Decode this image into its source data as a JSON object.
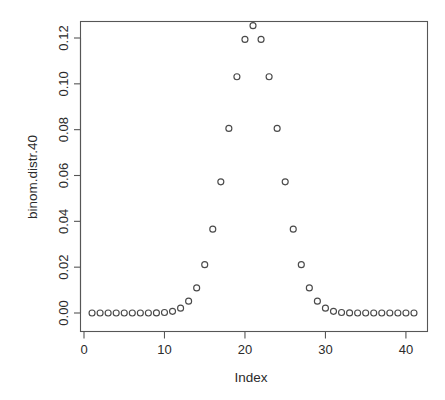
{
  "chart_data": {
    "type": "scatter",
    "title": "",
    "xlabel": "Index",
    "ylabel": "binom.distr.40",
    "xlim": [
      0,
      42
    ],
    "ylim": [
      0.0,
      0.1254
    ],
    "grid": false,
    "legend": "none",
    "marker": "open-circle",
    "marker_color": "#4a4a4a",
    "xticks": [
      0,
      10,
      20,
      30,
      40
    ],
    "xticklabels": [
      "0",
      "10",
      "20",
      "30",
      "40"
    ],
    "yticks": [
      0.0,
      0.02,
      0.04,
      0.06,
      0.08,
      0.1,
      0.12
    ],
    "yticklabels": [
      "0.00",
      "0.02",
      "0.04",
      "0.06",
      "0.08",
      "0.10",
      "0.12"
    ],
    "x": [
      1,
      2,
      3,
      4,
      5,
      6,
      7,
      8,
      9,
      10,
      11,
      12,
      13,
      14,
      15,
      16,
      17,
      18,
      19,
      20,
      21,
      22,
      23,
      24,
      25,
      26,
      27,
      28,
      29,
      30,
      31,
      32,
      33,
      34,
      35,
      36,
      37,
      38,
      39,
      40,
      41
    ],
    "values": [
      0.0,
      0.0,
      0.0,
      0.0,
      0.0,
      0.0,
      0.0,
      0.0,
      0.0,
      0.0,
      0.0002,
      0.0005,
      0.0019,
      0.0055,
      0.0139,
      0.0306,
      0.0117,
      0.0211,
      0.0366,
      0.0573,
      0.0805,
      0.1031,
      0.1194,
      0.1254,
      0.1194,
      0.1031,
      0.0805,
      0.0573,
      0.0366,
      0.0211,
      0.0117,
      0.0055,
      0.0019,
      0.0005,
      0.0002,
      0.0,
      0.0,
      0.0,
      0.0,
      0.0,
      0.0
    ],
    "series": [
      {
        "name": "binom.distr.40",
        "points": [
          [
            1,
            0.0
          ],
          [
            2,
            0.0
          ],
          [
            3,
            0.0
          ],
          [
            4,
            0.0
          ],
          [
            5,
            0.0
          ],
          [
            6,
            0.0
          ],
          [
            7,
            0.0
          ],
          [
            8,
            1e-05
          ],
          [
            9,
            5e-05
          ],
          [
            10,
            0.00021
          ],
          [
            11,
            0.00074
          ],
          [
            12,
            0.00211
          ],
          [
            13,
            0.00518
          ],
          [
            14,
            0.01095
          ],
          [
            15,
            0.0211
          ],
          [
            16,
            0.0366
          ],
          [
            17,
            0.05724
          ],
          [
            18,
            0.08054
          ],
          [
            19,
            0.1031
          ],
          [
            20,
            0.11938
          ],
          [
            21,
            0.12537
          ],
          [
            22,
            0.11938
          ],
          [
            23,
            0.1031
          ],
          [
            24,
            0.08054
          ],
          [
            25,
            0.05724
          ],
          [
            26,
            0.0366
          ],
          [
            27,
            0.0211
          ],
          [
            28,
            0.01095
          ],
          [
            29,
            0.00518
          ],
          [
            30,
            0.00211
          ],
          [
            31,
            0.00074
          ],
          [
            32,
            0.00021
          ],
          [
            33,
            5e-05
          ],
          [
            34,
            1e-05
          ],
          [
            35,
            0.0
          ],
          [
            36,
            0.0
          ],
          [
            37,
            0.0
          ],
          [
            38,
            0.0
          ],
          [
            39,
            0.0
          ],
          [
            40,
            0.0
          ],
          [
            41,
            0.0
          ]
        ]
      }
    ]
  },
  "axes": {
    "y_title": "binom.distr.40",
    "x_title": "Index"
  }
}
